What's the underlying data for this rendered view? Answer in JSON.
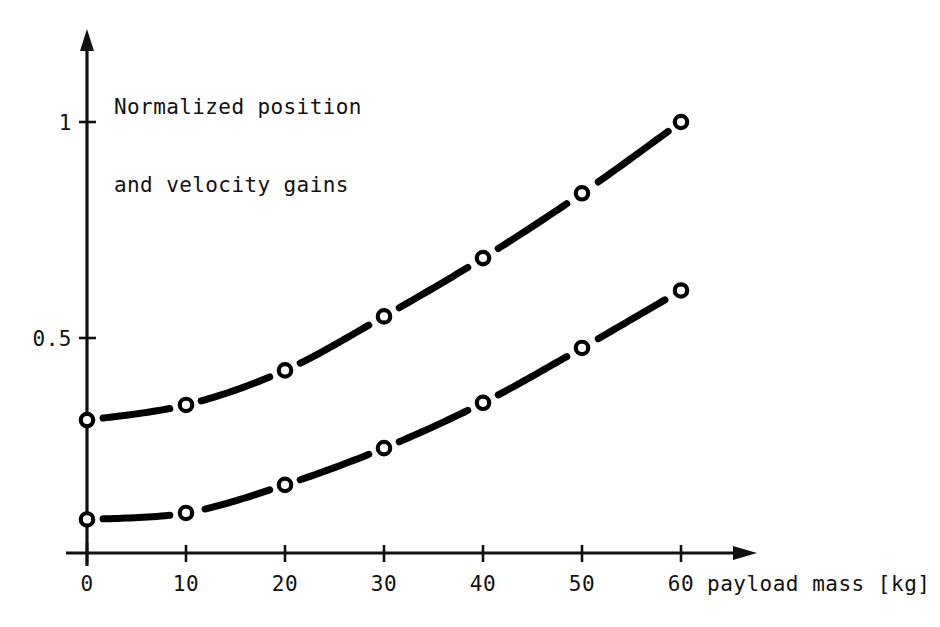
{
  "figure": {
    "background_color": "#ffffff",
    "ink_color": "#000000",
    "title_line_1": "Normalized position",
    "title_line_2": "and velocity gains",
    "x_axis_caption": "payload mass [kg]"
  },
  "chart_data": {
    "type": "line",
    "title": "Normalized position and velocity gains",
    "xlabel": "payload mass [kg]",
    "ylabel": "Normalized position and velocity gains",
    "x": [
      0,
      10,
      20,
      30,
      40,
      50,
      60
    ],
    "x_tick_labels": [
      "0",
      "10",
      "20",
      "30",
      "40",
      "50",
      "60"
    ],
    "y_tick_labels": [
      "0.5",
      "1"
    ],
    "y_tick_values": [
      0.5,
      1
    ],
    "xlim": [
      0,
      67
    ],
    "ylim": [
      0,
      1.2
    ],
    "grid": false,
    "legend": "none",
    "marker": "open-circle",
    "series": [
      {
        "name": "position gain",
        "values": [
          0.31,
          0.345,
          0.425,
          0.55,
          0.685,
          0.835,
          1.0
        ]
      },
      {
        "name": "velocity gain",
        "values": [
          0.08,
          0.095,
          0.16,
          0.245,
          0.35,
          0.477,
          0.61
        ]
      }
    ]
  },
  "axes": {
    "x_ticks": [
      {
        "label": "0",
        "value": 0
      },
      {
        "label": "10",
        "value": 10
      },
      {
        "label": "20",
        "value": 20
      },
      {
        "label": "30",
        "value": 30
      },
      {
        "label": "40",
        "value": 40
      },
      {
        "label": "50",
        "value": 50
      },
      {
        "label": "60",
        "value": 60
      }
    ],
    "y_ticks": [
      {
        "label": "1",
        "value": 1
      },
      {
        "label": "0.5",
        "value": 0.5
      }
    ]
  }
}
